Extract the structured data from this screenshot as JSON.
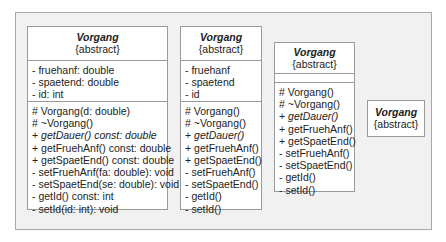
{
  "diagram": {
    "type": "UML class diagram variants",
    "classes": [
      {
        "name": "Vorgang",
        "stereotype": "{abstract}",
        "attributes": [
          "- fruehanf: double",
          "- spaetend: double",
          "- id: int"
        ],
        "operations": [
          {
            "text": "# Vorgang(d: double)",
            "italic": false
          },
          {
            "text": "# ~Vorgang()",
            "italic": false
          },
          {
            "vis": "+ ",
            "text": "getDauer() const: double",
            "italic": true
          },
          {
            "text": "+ getFruehAnf() const: double",
            "italic": false
          },
          {
            "text": "+ getSpaetEnd() const: double",
            "italic": false
          },
          {
            "text": "- setFruehAnf(fa: double): void",
            "italic": false
          },
          {
            "text": "- setSpaetEnd(se: double): void",
            "italic": false
          },
          {
            "text": "- getId() const: int",
            "italic": false
          },
          {
            "text": "- setId(id: int): void",
            "italic": false
          }
        ]
      },
      {
        "name": "Vorgang",
        "stereotype": "{abstract}",
        "attributes": [
          "- fruehanf",
          "- spaetend",
          "- id"
        ],
        "operations": [
          {
            "text": "# Vorgang()",
            "italic": false
          },
          {
            "text": "# ~Vorgang()",
            "italic": false
          },
          {
            "vis": "+ ",
            "text": "getDauer()",
            "italic": true
          },
          {
            "text": "+ getFruehAnf()",
            "italic": false
          },
          {
            "text": "+ getSpaetEnd()",
            "italic": false
          },
          {
            "text": "- setFruehAnf()",
            "italic": false
          },
          {
            "text": "- setSpaetEnd()",
            "italic": false
          },
          {
            "text": "- getId()",
            "italic": false
          },
          {
            "text": "- setId()",
            "italic": false
          }
        ]
      },
      {
        "name": "Vorgang",
        "stereotype": "{abstract}",
        "attributes": [],
        "operations": [
          {
            "text": "# Vorgang()",
            "italic": false
          },
          {
            "text": "# ~Vorgang()",
            "italic": false
          },
          {
            "vis": "+ ",
            "text": "getDauer()",
            "italic": true
          },
          {
            "text": "+ getFruehAnf()",
            "italic": false
          },
          {
            "text": "+ getSpaetEnd()",
            "italic": false
          },
          {
            "text": "- setFruehAnf()",
            "italic": false
          },
          {
            "text": "- setSpaetEnd()",
            "italic": false
          },
          {
            "text": "- getId()",
            "italic": false
          },
          {
            "text": "- setId()",
            "italic": false
          }
        ]
      },
      {
        "name": "Vorgang",
        "stereotype": "{abstract}"
      }
    ]
  }
}
